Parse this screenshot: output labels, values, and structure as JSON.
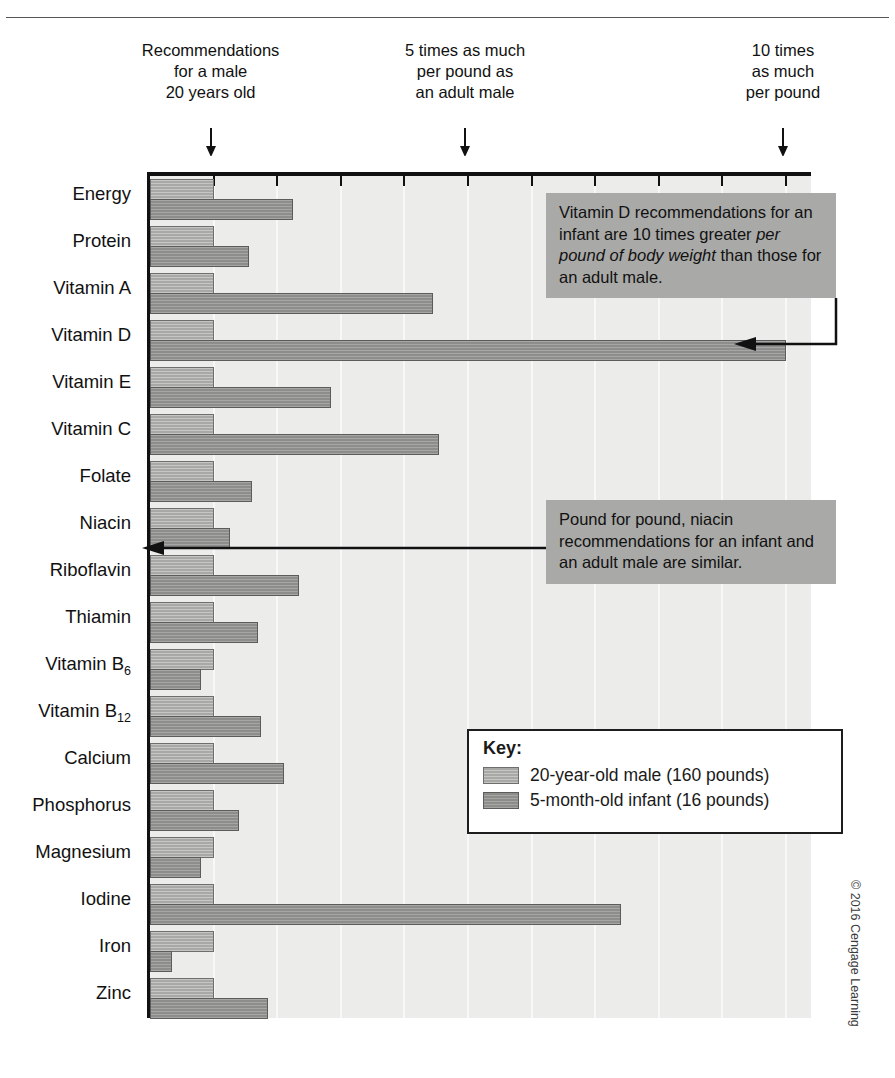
{
  "figure": {
    "clipped_top_text_left": "",
    "clipped_top_text_right": "",
    "copyright": "© 2016 Cengage Learning"
  },
  "headers": [
    {
      "id": "baseline",
      "lines": [
        "Recommendations",
        "for a male",
        "20 years old"
      ],
      "value": 1
    },
    {
      "id": "five-times",
      "lines": [
        "5 times as much",
        "per pound as",
        "an adult male"
      ],
      "value": 5
    },
    {
      "id": "ten-times",
      "lines": [
        "10 times",
        "as much",
        "per pound"
      ],
      "value": 10
    }
  ],
  "callouts": [
    {
      "id": "vitamin-d-callout",
      "segments": [
        {
          "text": "Vitamin D recommendations for an infant are 10 times greater ",
          "italic": false
        },
        {
          "text": "per pound of body weight",
          "italic": true
        },
        {
          "text": " than those for an adult male.",
          "italic": false
        }
      ],
      "plain": "Vitamin D recommendations for an infant are 10 times greater per pound of body weight than those for an adult male."
    },
    {
      "id": "niacin-callout",
      "segments": [
        {
          "text": "Pound for pound, niacin recommendations for an infant and an adult male are similar.",
          "italic": false
        }
      ],
      "plain": "Pound for pound, niacin recommendations for an infant and an adult male are similar."
    }
  ],
  "key": {
    "title": "Key:",
    "entries": [
      {
        "id": "adult",
        "label": "20-year-old male (160 pounds)",
        "color": "#a8a8a6"
      },
      {
        "id": "infant",
        "label": "5-month-old infant (16 pounds)",
        "color": "#8d8d8b"
      }
    ]
  },
  "chart_data": {
    "type": "bar",
    "orientation": "horizontal",
    "title": "",
    "xlabel": "",
    "ylabel": "",
    "xlim": [
      0,
      10.45
    ],
    "grid": true,
    "xticks": [
      1,
      2,
      3,
      4,
      5,
      6,
      7,
      8,
      9,
      10
    ],
    "xtick_labels": [
      "",
      "",
      "",
      "",
      "",
      "",
      "",
      "",
      "",
      ""
    ],
    "reference_markers": [
      {
        "value": 1,
        "label": "Recommendations for a male 20 years old"
      },
      {
        "value": 5,
        "label": "5 times as much per pound as an adult male"
      },
      {
        "value": 10,
        "label": "10 times as much per pound"
      }
    ],
    "categories": [
      "Energy",
      "Protein",
      "Vitamin A",
      "Vitamin D",
      "Vitamin E",
      "Vitamin C",
      "Folate",
      "Niacin",
      "Riboflavin",
      "Thiamin",
      "Vitamin B6",
      "Vitamin B12",
      "Calcium",
      "Phosphorus",
      "Magnesium",
      "Iodine",
      "Iron",
      "Zinc"
    ],
    "category_labels_html": [
      "Energy",
      "Protein",
      "Vitamin A",
      "Vitamin D",
      "Vitamin E",
      "Vitamin C",
      "Folate",
      "Niacin",
      "Riboflavin",
      "Thiamin",
      "Vitamin B<sub>6</sub>",
      "Vitamin B<sub>12</sub>",
      "Calcium",
      "Phosphorus",
      "Magnesium",
      "Iodine",
      "Iron",
      "Zinc"
    ],
    "series": [
      {
        "name": "20-year-old male (160 pounds)",
        "id": "adult",
        "color": "#a8a8a6",
        "values": [
          1,
          1,
          1,
          1,
          1,
          1,
          1,
          1,
          1,
          1,
          1,
          1,
          1,
          1,
          1,
          1,
          1,
          1
        ]
      },
      {
        "name": "5-month-old infant (16 pounds)",
        "id": "infant",
        "color": "#8d8d8b",
        "values": [
          2.25,
          1.55,
          4.45,
          10.0,
          2.85,
          4.55,
          1.6,
          1.25,
          2.35,
          1.7,
          0.8,
          1.75,
          2.1,
          1.4,
          0.8,
          7.4,
          0.35,
          1.85
        ]
      }
    ]
  }
}
